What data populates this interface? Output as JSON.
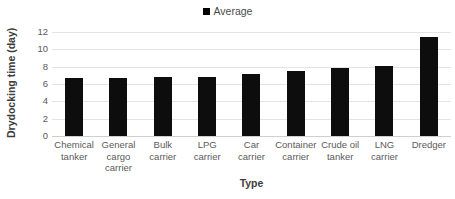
{
  "chart_data": {
    "type": "bar",
    "title": "",
    "categories": [
      "Chemical tanker",
      "General cargo carrier",
      "Bulk carrier",
      "LPG carrier",
      "Car carrier",
      "Container carrier",
      "Crude oil tanker",
      "LNG carrier",
      "Dredger"
    ],
    "category_lines": [
      [
        "Chemical",
        "tanker"
      ],
      [
        "General",
        "cargo",
        "carrier"
      ],
      [
        "Bulk",
        "carrier"
      ],
      [
        "LPG",
        "carrier"
      ],
      [
        "Car",
        "carrier"
      ],
      [
        "Container",
        "carrier"
      ],
      [
        "Crude oil",
        "tanker"
      ],
      [
        "LNG",
        "carrier"
      ],
      [
        "Dredger"
      ]
    ],
    "series": [
      {
        "name": "Average",
        "values": [
          6.75,
          6.65,
          6.85,
          6.85,
          7.1,
          7.5,
          7.85,
          8.1,
          11.45
        ],
        "color": "#0d0d0d"
      }
    ],
    "values": [
      6.75,
      6.65,
      6.85,
      6.85,
      7.1,
      7.5,
      7.85,
      8.1,
      11.45
    ],
    "xlabel": "Type",
    "ylabel": "Drydocking time (day)",
    "ylim": [
      0,
      12
    ],
    "yticks": [
      0,
      2,
      4,
      6,
      8,
      10,
      12
    ],
    "ytick_labels": [
      "0",
      "2",
      "4",
      "6",
      "8",
      "10",
      "12"
    ],
    "grid": true,
    "grid_axis": "y",
    "grid_color": "#e4e4e4",
    "legend": {
      "position": "top",
      "entries": [
        {
          "label": "Average",
          "color": "#0d0d0d",
          "marker": "square"
        }
      ]
    },
    "background": "#ffffff"
  }
}
